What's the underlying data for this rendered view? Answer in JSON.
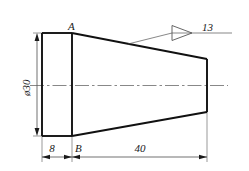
{
  "drawing": {
    "type": "mechanical-part-technical-drawing",
    "background_color": "#ffffff",
    "line_color": "#1a1a1a",
    "thin_line_color": "#555555",
    "title": "",
    "part_description": "Tapered conical plug with cylindrical collar",
    "labels": {
      "point_a": "A",
      "point_b": "B"
    },
    "dimensions": {
      "diameter_vertical": "ø30",
      "collar_length": "8",
      "taper_length": "40"
    },
    "annotations": {
      "surface_finish_value": "13",
      "surface_finish_symbol": "triangle"
    },
    "geometry": {
      "left_face_x": 42,
      "collar_right_x": 72,
      "right_face_x": 207,
      "top_y": 33,
      "bottom_y": 136,
      "right_top_y": 59,
      "right_bottom_y": 112,
      "centerline_y": 85.5
    }
  }
}
